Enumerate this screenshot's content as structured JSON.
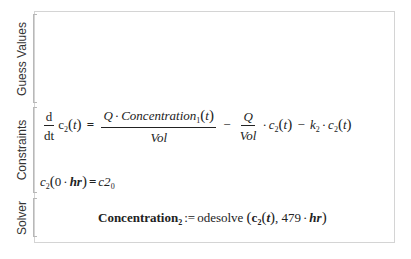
{
  "regions": [
    {
      "label": "Guess Values"
    },
    {
      "label": "Constraints"
    },
    {
      "label": "Solver"
    }
  ],
  "constraints": {
    "ode": {
      "d": "d",
      "dt": "dt",
      "lhs_var": "c",
      "lhs_sub": "2",
      "t": "t",
      "equals": "=",
      "num_Q": "Q",
      "dot": "·",
      "conc": "Concentration",
      "conc_sub": "1",
      "den_vol": "Vol",
      "minus": "−",
      "Q2": "Q",
      "vol2": "Vol",
      "c_var": "c",
      "c_sub": "2",
      "k_var": "k",
      "k_sub": "2"
    },
    "initial": {
      "c_var": "c",
      "c_sub": "2",
      "zero": "0",
      "dot": "·",
      "hr": "hr",
      "equals": "=",
      "rhs": "c2",
      "rhs_sub": "0"
    }
  },
  "solver": {
    "lhs": "Concentration",
    "lhs_sub": "2",
    "assign": ":=",
    "func": "odesolve",
    "arg_var": "c",
    "arg_sub": "2",
    "arg_t": "t",
    "comma": ",",
    "end_value": "479",
    "dot": "·",
    "unit": "hr"
  }
}
